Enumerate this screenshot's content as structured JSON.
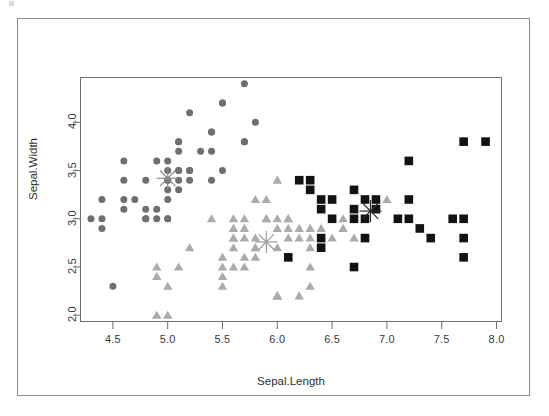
{
  "figure": {
    "title": "",
    "background_color": "#ffffff",
    "outer_border_color": "#8d8d8d",
    "plot_border_color": "#6e6e6e"
  },
  "axes": {
    "x_title": "Sepal.Length",
    "y_title": "Sepal.Width",
    "x_ticks": [
      "4.5",
      "5.0",
      "5.5",
      "6.0",
      "6.5",
      "7.0",
      "7.5",
      "8.0"
    ],
    "y_ticks": [
      "2.0",
      "2.5",
      "3.0",
      "3.5",
      "4.0"
    ],
    "x_tick_values": [
      4.5,
      5.0,
      5.5,
      6.0,
      6.5,
      7.0,
      7.5,
      8.0
    ],
    "y_tick_values": [
      2.0,
      2.5,
      3.0,
      3.5,
      4.0
    ]
  },
  "chart_data": {
    "type": "scatter",
    "title": "",
    "xlabel": "Sepal.Length",
    "ylabel": "Sepal.Width",
    "xlim": [
      4.2,
      8.05
    ],
    "ylim": [
      1.93,
      4.47
    ],
    "grid": false,
    "legend": "none",
    "series": [
      {
        "name": "cluster-1",
        "marker": "circle",
        "color": "#6f6f6f",
        "size": 5,
        "points": [
          [
            4.3,
            3.0
          ],
          [
            4.4,
            3.2
          ],
          [
            4.4,
            3.0
          ],
          [
            4.4,
            2.9
          ],
          [
            4.5,
            2.3
          ],
          [
            4.6,
            3.6
          ],
          [
            4.6,
            3.4
          ],
          [
            4.6,
            3.1
          ],
          [
            4.6,
            3.2
          ],
          [
            4.7,
            3.2
          ],
          [
            4.8,
            3.4
          ],
          [
            4.8,
            3.0
          ],
          [
            4.8,
            3.1
          ],
          [
            4.8,
            3.0
          ],
          [
            4.9,
            3.1
          ],
          [
            4.9,
            3.0
          ],
          [
            4.9,
            3.6
          ],
          [
            5.0,
            3.6
          ],
          [
            5.0,
            3.4
          ],
          [
            5.0,
            3.0
          ],
          [
            5.0,
            3.4
          ],
          [
            5.0,
            3.5
          ],
          [
            5.0,
            3.2
          ],
          [
            5.0,
            3.3
          ],
          [
            5.0,
            3.0
          ],
          [
            5.1,
            3.5
          ],
          [
            5.1,
            3.5
          ],
          [
            5.1,
            3.8
          ],
          [
            5.1,
            3.7
          ],
          [
            5.1,
            3.3
          ],
          [
            5.1,
            3.4
          ],
          [
            5.1,
            3.8
          ],
          [
            5.2,
            3.5
          ],
          [
            5.2,
            3.4
          ],
          [
            5.2,
            4.1
          ],
          [
            5.2,
            3.5
          ],
          [
            5.3,
            3.7
          ],
          [
            5.4,
            3.9
          ],
          [
            5.4,
            3.7
          ],
          [
            5.4,
            3.4
          ],
          [
            5.4,
            3.9
          ],
          [
            5.5,
            4.2
          ],
          [
            5.5,
            3.5
          ],
          [
            5.5,
            4.2
          ],
          [
            5.7,
            4.4
          ],
          [
            5.7,
            3.8
          ],
          [
            5.7,
            3.8
          ],
          [
            5.8,
            4.0
          ]
        ]
      },
      {
        "name": "cluster-2",
        "marker": "triangle",
        "color": "#ababab",
        "size": 5,
        "points": [
          [
            4.9,
            2.4
          ],
          [
            4.9,
            2.5
          ],
          [
            4.9,
            2.0
          ],
          [
            5.0,
            2.3
          ],
          [
            5.0,
            2.0
          ],
          [
            5.1,
            2.5
          ],
          [
            5.2,
            2.7
          ],
          [
            5.4,
            3.0
          ],
          [
            5.5,
            2.3
          ],
          [
            5.5,
            2.4
          ],
          [
            5.5,
            2.5
          ],
          [
            5.5,
            2.6
          ],
          [
            5.6,
            2.9
          ],
          [
            5.6,
            3.0
          ],
          [
            5.6,
            2.5
          ],
          [
            5.6,
            2.7
          ],
          [
            5.6,
            2.8
          ],
          [
            5.6,
            2.8
          ],
          [
            5.7,
            2.8
          ],
          [
            5.7,
            3.0
          ],
          [
            5.7,
            2.6
          ],
          [
            5.7,
            2.9
          ],
          [
            5.7,
            2.5
          ],
          [
            5.8,
            2.7
          ],
          [
            5.8,
            2.7
          ],
          [
            5.8,
            2.6
          ],
          [
            5.8,
            2.8
          ],
          [
            5.8,
            3.2
          ],
          [
            5.9,
            3.0
          ],
          [
            5.9,
            3.2
          ],
          [
            5.9,
            3.0
          ],
          [
            6.0,
            2.2
          ],
          [
            6.0,
            2.9
          ],
          [
            6.0,
            2.2
          ],
          [
            6.0,
            3.0
          ],
          [
            6.0,
            2.7
          ],
          [
            6.0,
            3.4
          ],
          [
            6.0,
            2.2
          ],
          [
            6.1,
            2.9
          ],
          [
            6.1,
            2.8
          ],
          [
            6.1,
            3.0
          ],
          [
            6.1,
            2.6
          ],
          [
            6.1,
            3.0
          ],
          [
            6.2,
            2.2
          ],
          [
            6.2,
            2.9
          ],
          [
            6.2,
            2.8
          ],
          [
            6.3,
            2.5
          ],
          [
            6.3,
            2.3
          ],
          [
            6.3,
            2.8
          ],
          [
            6.3,
            2.9
          ],
          [
            6.3,
            2.7
          ],
          [
            6.4,
            2.9
          ],
          [
            6.4,
            2.8
          ],
          [
            6.4,
            3.2
          ],
          [
            6.5,
            2.8
          ],
          [
            6.5,
            3.0
          ],
          [
            6.6,
            2.9
          ],
          [
            6.6,
            3.0
          ],
          [
            6.7,
            3.1
          ],
          [
            6.7,
            2.8
          ],
          [
            6.9,
            3.1
          ],
          [
            7.0,
            3.2
          ]
        ]
      },
      {
        "name": "cluster-3",
        "marker": "square",
        "color": "#121212",
        "size": 6,
        "points": [
          [
            6.2,
            3.4
          ],
          [
            6.3,
            3.4
          ],
          [
            6.3,
            3.3
          ],
          [
            6.1,
            2.6
          ],
          [
            6.4,
            3.2
          ],
          [
            6.4,
            3.1
          ],
          [
            6.4,
            2.8
          ],
          [
            6.4,
            2.7
          ],
          [
            6.5,
            3.2
          ],
          [
            6.5,
            3.0
          ],
          [
            6.7,
            3.3
          ],
          [
            6.7,
            3.1
          ],
          [
            6.7,
            3.0
          ],
          [
            6.7,
            2.5
          ],
          [
            6.8,
            3.2
          ],
          [
            6.8,
            3.0
          ],
          [
            6.8,
            2.8
          ],
          [
            6.9,
            3.2
          ],
          [
            6.9,
            3.1
          ],
          [
            7.1,
            3.0
          ],
          [
            7.2,
            3.6
          ],
          [
            7.2,
            3.2
          ],
          [
            7.2,
            3.0
          ],
          [
            7.3,
            2.9
          ],
          [
            7.4,
            2.8
          ],
          [
            7.6,
            3.0
          ],
          [
            7.7,
            3.8
          ],
          [
            7.7,
            2.6
          ],
          [
            7.7,
            2.8
          ],
          [
            7.7,
            3.0
          ],
          [
            7.9,
            3.8
          ]
        ]
      }
    ],
    "centroids": [
      {
        "name": "centroid-cluster-1",
        "x": 5.0,
        "y": 3.42,
        "color": "#8a8a8a",
        "marker": "asterisk"
      },
      {
        "name": "centroid-cluster-2",
        "x": 5.9,
        "y": 2.76,
        "color": "#9d9d9d",
        "marker": "asterisk"
      },
      {
        "name": "centroid-cluster-3",
        "x": 6.85,
        "y": 3.08,
        "color": "#2b2b2b",
        "marker": "asterisk"
      }
    ]
  }
}
